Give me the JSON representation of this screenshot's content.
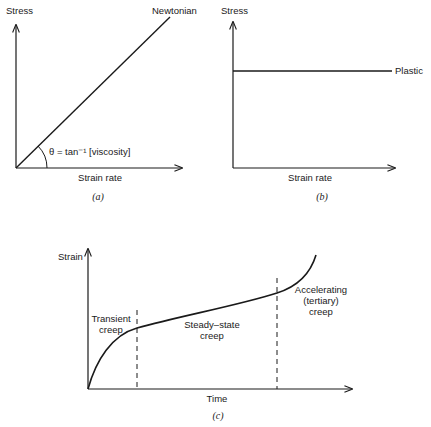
{
  "panel_a": {
    "y_label": "Stress",
    "x_label": "Strain rate",
    "line_label": "Newtonian",
    "angle_label": "θ = tan⁻¹ [viscosity]",
    "caption": "(a)"
  },
  "panel_b": {
    "y_label": "Stress",
    "x_label": "Strain rate",
    "line_label": "Plastic",
    "caption": "(b)"
  },
  "panel_c": {
    "y_label": "Strain",
    "x_label": "Time",
    "regions": [
      {
        "line1": "Transient",
        "line2": "creep"
      },
      {
        "line1": "Steady–state",
        "line2": "creep"
      },
      {
        "line1": "Accelerating",
        "line2": "(tertiary)",
        "line3": "creep"
      }
    ],
    "caption": "(c)"
  },
  "colors": {
    "ink": "#1a1a1a",
    "background": "#ffffff"
  }
}
